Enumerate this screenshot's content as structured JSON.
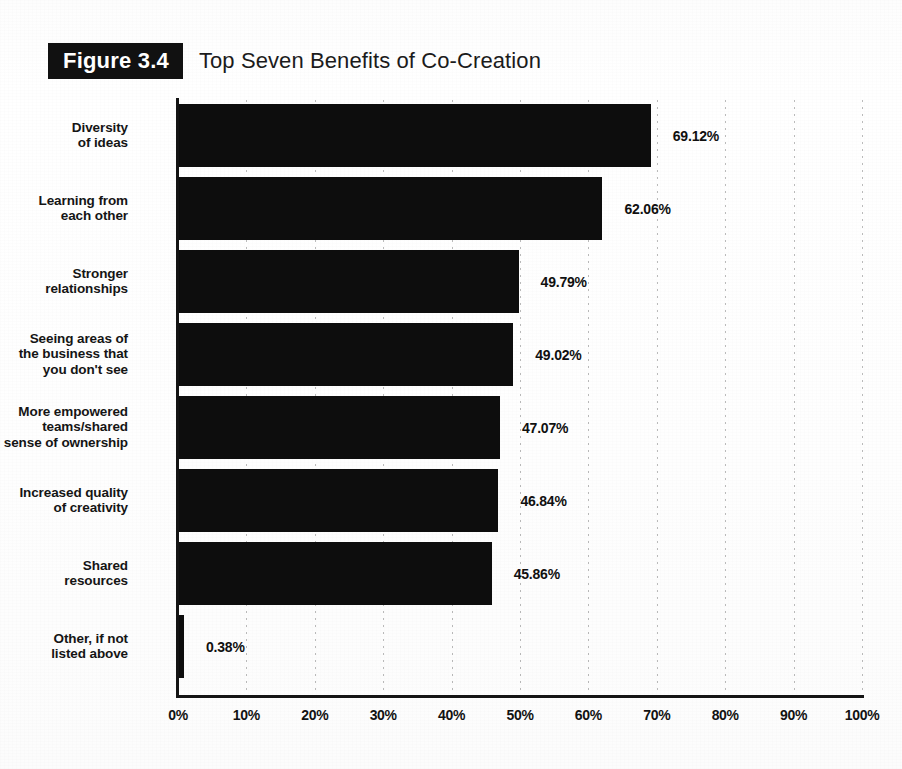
{
  "figure": {
    "badge": "Figure 3.4",
    "title": "Top Seven Benefits of Co-Creation"
  },
  "chart_data": {
    "type": "bar",
    "orientation": "horizontal",
    "title": "Top Seven Benefits of Co-Creation",
    "xlabel": "",
    "ylabel": "",
    "xlim": [
      0,
      100
    ],
    "grid": true,
    "legend": "none",
    "bar_color": "#0d0d0d",
    "categories": [
      "Diversity\nof ideas",
      "Learning from\neach other",
      "Stronger\nrelationships",
      "Seeing areas of\nthe business that\nyou don't see",
      "More empowered\nteams/shared\nsense of ownership",
      "Increased quality\nof creativity",
      "Shared\nresources",
      "Other, if not\nlisted above"
    ],
    "values": [
      69.12,
      62.06,
      49.79,
      49.02,
      47.07,
      46.84,
      45.86,
      0.38
    ],
    "value_labels": [
      "69.12%",
      "62.06%",
      "49.79%",
      "49.02%",
      "47.07%",
      "46.84%",
      "45.86%",
      "0.38%"
    ],
    "xticks": [
      0,
      10,
      20,
      30,
      40,
      50,
      60,
      70,
      80,
      90,
      100
    ],
    "xtick_labels": [
      "0%",
      "10%",
      "20%",
      "30%",
      "40%",
      "50%",
      "60%",
      "70%",
      "80%",
      "90%",
      "100%"
    ],
    "rows": [
      {
        "label_line1": "Diversity",
        "label_line2": "of ideas",
        "label_line3": "",
        "value": 69.12,
        "value_label": "69.12%"
      },
      {
        "label_line1": "Learning from",
        "label_line2": "each other",
        "label_line3": "",
        "value": 62.06,
        "value_label": "62.06%"
      },
      {
        "label_line1": "Stronger",
        "label_line2": "relationships",
        "label_line3": "",
        "value": 49.79,
        "value_label": "49.79%"
      },
      {
        "label_line1": "Seeing areas of",
        "label_line2": "the business that",
        "label_line3": "you don't see",
        "value": 49.02,
        "value_label": "49.02%"
      },
      {
        "label_line1": "More empowered",
        "label_line2": "teams/shared",
        "label_line3": "sense of ownership",
        "value": 47.07,
        "value_label": "47.07%"
      },
      {
        "label_line1": "Increased quality",
        "label_line2": "of creativity",
        "label_line3": "",
        "value": 46.84,
        "value_label": "46.84%"
      },
      {
        "label_line1": "Shared",
        "label_line2": "resources",
        "label_line3": "",
        "value": 45.86,
        "value_label": "45.86%"
      },
      {
        "label_line1": "Other, if not",
        "label_line2": "listed above",
        "label_line3": "",
        "value": 0.38,
        "value_label": "0.38%"
      }
    ]
  }
}
